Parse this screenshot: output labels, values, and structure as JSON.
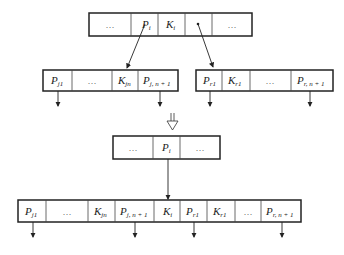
{
  "diagram": {
    "type": "B+ tree node merge / split illustration",
    "top_node": {
      "cells": [
        {
          "main": "…",
          "sub": ""
        },
        {
          "main": "P",
          "sub": "i"
        },
        {
          "main": "K",
          "sub": "i"
        },
        {
          "main": "•",
          "sub": ""
        },
        {
          "main": "…",
          "sub": ""
        }
      ]
    },
    "left_child": {
      "cells": [
        {
          "main": "P",
          "sub": "j1"
        },
        {
          "main": "…",
          "sub": ""
        },
        {
          "main": "K",
          "sub": "jn"
        },
        {
          "main": "P",
          "sub": "j, n + 1"
        }
      ]
    },
    "right_child": {
      "cells": [
        {
          "main": "P",
          "sub": "r1"
        },
        {
          "main": "K",
          "sub": "r1"
        },
        {
          "main": "…",
          "sub": ""
        },
        {
          "main": "P",
          "sub": "r, n + 1"
        }
      ]
    },
    "transition_arrow": "⇓",
    "parent_after": {
      "cells": [
        {
          "main": "…",
          "sub": ""
        },
        {
          "main": "P",
          "sub": "i"
        },
        {
          "main": "…",
          "sub": ""
        }
      ]
    },
    "merged_node": {
      "cells": [
        {
          "main": "P",
          "sub": "j1"
        },
        {
          "main": "…",
          "sub": ""
        },
        {
          "main": "K",
          "sub": "jn"
        },
        {
          "main": "P",
          "sub": "j, n + 1"
        },
        {
          "main": "K",
          "sub": "i"
        },
        {
          "main": "P",
          "sub": "r1"
        },
        {
          "main": "K",
          "sub": "r1"
        },
        {
          "main": "…",
          "sub": ""
        },
        {
          "main": "P",
          "sub": "r, n + 1"
        }
      ]
    }
  }
}
